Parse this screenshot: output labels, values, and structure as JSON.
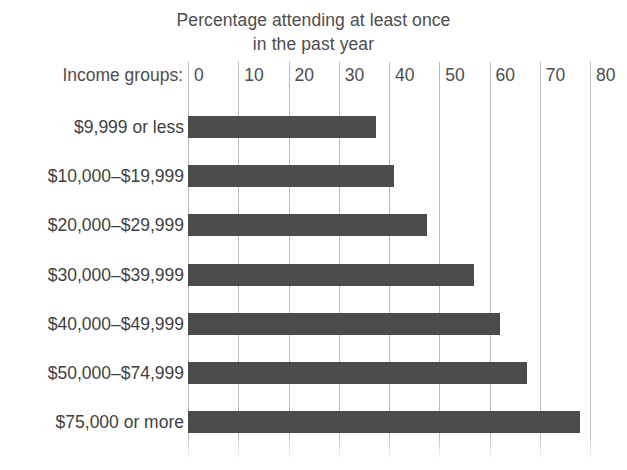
{
  "chart_data": {
    "type": "bar",
    "orientation": "horizontal",
    "title": "Percentage attending at least once in the past year",
    "title_lines": [
      "Percentage attending at least once",
      "in the past year"
    ],
    "axis_caption": "Income groups:",
    "xlabel": "",
    "ylabel": "Income groups",
    "xlim": [
      0,
      80
    ],
    "xticks": [
      0,
      10,
      20,
      30,
      40,
      50,
      60,
      70,
      80
    ],
    "xtick_labels": [
      "0",
      "10",
      "20",
      "30",
      "40",
      "50",
      "60",
      "70",
      "80"
    ],
    "grid": true,
    "legend": false,
    "bar_color": "#4b4b4b",
    "gridline_color": "#b9b9b9",
    "categories": [
      "$9,999 or less",
      "$10,000–$19,999",
      "$20,000–$29,999",
      "$30,000–$39,999",
      "$40,000–$49,999",
      "$50,000–$74,999",
      "$75,000 or more"
    ],
    "values": [
      37.5,
      41,
      47.5,
      57,
      62,
      67.5,
      78
    ]
  }
}
